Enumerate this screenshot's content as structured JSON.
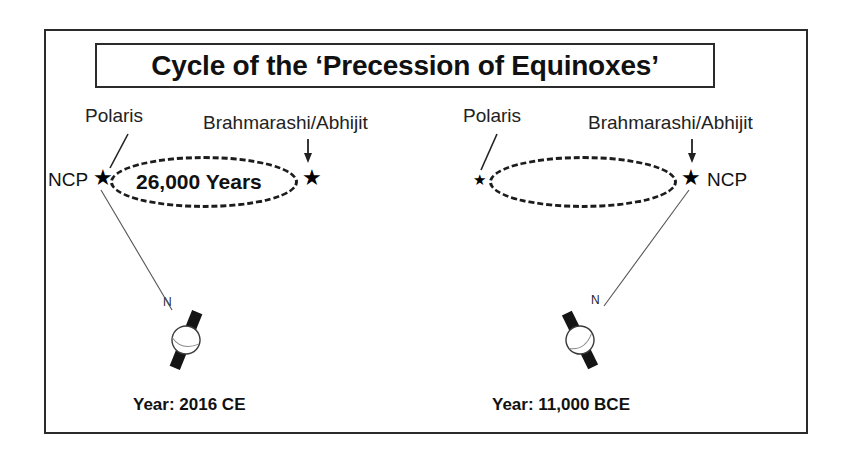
{
  "figure": {
    "title": "Cycle of the ‘Precession of Equinoxes’",
    "background_color": "#ffffff",
    "line_color": "#2b2b2b"
  },
  "panels": [
    {
      "id": "left-panel",
      "caption": "Year: 2016 CE",
      "ncp_label": "NCP",
      "ncp_side": "left",
      "polaris_label": "Polaris",
      "brahmarashi_label": "Brahmarashi/Abhijit",
      "cycle_label": "26,000 Years",
      "north_pole_label": "N",
      "ncp_star": "★",
      "other_star": "★"
    },
    {
      "id": "right-panel",
      "caption": "Year: 11,000 BCE",
      "ncp_label": "NCP",
      "ncp_side": "right",
      "polaris_label": "Polaris",
      "brahmarashi_label": "Brahmarashi/Abhijit",
      "cycle_label": "",
      "north_pole_label": "N",
      "ncp_star": "★",
      "other_star": "★"
    }
  ],
  "icons": {
    "star": "star-icon",
    "down_arrow": "down-arrow-icon",
    "globe": "globe-icon",
    "pointer_line": "pointer-line-icon"
  }
}
